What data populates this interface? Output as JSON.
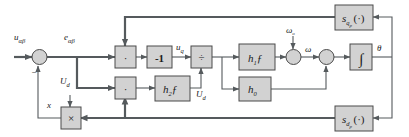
{
  "figure": {
    "type": "control-block-diagram",
    "title": "",
    "background_color": "#ffffff",
    "block_fill": "#d2d2d2",
    "block_stroke": "#4a4a4a",
    "wire_color": "#555a5d"
  },
  "signals": {
    "input_u_alpha_beta": "u",
    "input_u_alpha_beta_sub": "αβ",
    "error_e_alpha_beta": "e",
    "error_e_alpha_beta_sub": "αβ",
    "u_q": "u",
    "u_q_sub": "q",
    "U_d_left": "U",
    "U_d_left_sub": "d",
    "U_d_mid": "U",
    "U_d_mid_sub": "d",
    "x": "x",
    "omega_0": "ω",
    "omega_0_sub": "o",
    "omega": "ω",
    "theta": "θ",
    "minus_sign": "−"
  },
  "blocks": [
    {
      "id": "mult-top",
      "label": "·",
      "kind": "multiplier"
    },
    {
      "id": "gain-minus-one",
      "label": "-1",
      "kind": "gain"
    },
    {
      "id": "divide",
      "label": "÷",
      "kind": "divider"
    },
    {
      "id": "h1f",
      "label": "h",
      "sub": "1",
      "tail": "ƒ",
      "kind": "gain"
    },
    {
      "id": "integrator",
      "label": "∫",
      "kind": "integrator"
    },
    {
      "id": "mult-bottom",
      "label": "·",
      "kind": "multiplier"
    },
    {
      "id": "h2f",
      "label": "h",
      "sub": "2",
      "tail": "ƒ",
      "kind": "gain"
    },
    {
      "id": "h0",
      "label": "h",
      "sub": "0",
      "tail": "",
      "kind": "gain"
    },
    {
      "id": "s-qp",
      "label": "s",
      "sub": "q",
      "subsub": "p",
      "tail": "(·)",
      "kind": "function"
    },
    {
      "id": "s-dp",
      "label": "s",
      "sub": "d",
      "subsub": "p",
      "tail": "(·)",
      "kind": "function"
    },
    {
      "id": "cross-mult",
      "label": "×",
      "kind": "multiplier"
    }
  ],
  "junctions": [
    {
      "id": "sum-input",
      "kind": "summing-junction",
      "signs": [
        "+",
        "−"
      ]
    },
    {
      "id": "sum-omega",
      "kind": "summing-junction",
      "signs": [
        "+",
        "+"
      ]
    },
    {
      "id": "sum-h0",
      "kind": "summing-junction",
      "signs": [
        "+",
        "+"
      ]
    }
  ],
  "labels": {
    "gain_minus_one": "-1",
    "divide_glyph": "÷",
    "integral_glyph": "∫",
    "cross_glyph": "×",
    "dot_glyph": "·",
    "paren_dot": "(·)",
    "h_letter": "h",
    "s_letter": "s",
    "f_letter": "ƒ",
    "h1_sub": "1",
    "h2_sub": "2",
    "h0_sub": "0",
    "sq_sub": "q",
    "sq_subsub": "p",
    "sd_sub": "d",
    "sd_subsub": "p"
  }
}
